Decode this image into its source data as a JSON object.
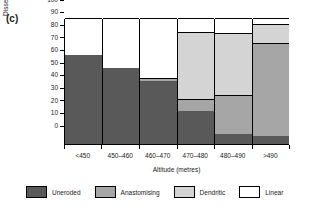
{
  "panel_label": "(c)",
  "chart_data": {
    "type": "bar",
    "subtype": "stacked-100-percent",
    "title": "",
    "xlabel": "Altitude (metres)",
    "ylabel": "Dissection (%)",
    "categories": [
      "<450",
      "450–460",
      "460–470",
      "470–480",
      "480–490",
      ">490"
    ],
    "ylim": [
      0,
      100
    ],
    "yticks": [
      0,
      10,
      20,
      30,
      40,
      50,
      60,
      70,
      80,
      90,
      100
    ],
    "ytick_labels": [
      "0",
      "10",
      "20",
      "30",
      "40",
      "50",
      "60",
      "70",
      "80",
      "90",
      "100"
    ],
    "grid": false,
    "legend_position": "bottom",
    "series": [
      {
        "name": "Uneroded",
        "color": "#595959",
        "values": [
          71,
          60,
          50,
          26,
          8,
          6
        ]
      },
      {
        "name": "Anastomising",
        "color": "#a6a6a6",
        "values": [
          0,
          0,
          2,
          10,
          31,
          74
        ]
      },
      {
        "name": "Dendritic",
        "color": "#d4d4d4",
        "values": [
          0,
          0,
          0,
          53,
          49,
          15
        ]
      },
      {
        "name": "Linear",
        "color": "#ffffff",
        "values": [
          29,
          40,
          48,
          11,
          12,
          5
        ]
      }
    ],
    "cumulative_tops": [
      {
        "category": "<450",
        "uneroded": 71,
        "anastomising": 71,
        "dendritic": 71,
        "linear": 100
      },
      {
        "category": "450–460",
        "uneroded": 60,
        "anastomising": 60,
        "dendritic": 60,
        "linear": 100
      },
      {
        "category": "460–470",
        "uneroded": 50,
        "anastomising": 52,
        "dendritic": 52,
        "linear": 100
      },
      {
        "category": "470–480",
        "uneroded": 26,
        "anastomising": 36,
        "dendritic": 89,
        "linear": 100
      },
      {
        "category": "480–490",
        "uneroded": 8,
        "anastomising": 39,
        "dendritic": 88,
        "linear": 100
      },
      {
        "category": ">490",
        "uneroded": 6,
        "anastomising": 80,
        "dendritic": 95,
        "linear": 100
      }
    ]
  },
  "legend": [
    {
      "label": "Uneroded",
      "color": "#595959"
    },
    {
      "label": "Anastomising",
      "color": "#a6a6a6"
    },
    {
      "label": "Dendritic",
      "color": "#d4d4d4"
    },
    {
      "label": "Linear",
      "color": "#ffffff"
    }
  ]
}
